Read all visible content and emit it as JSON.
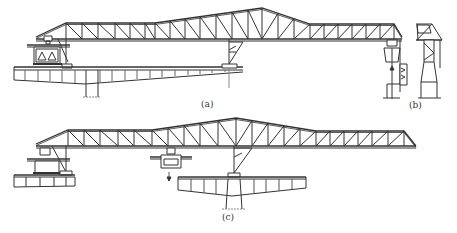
{
  "figure": {
    "stroke_color": "#333333",
    "light_stroke": "#888888",
    "background": "#ffffff"
  },
  "panels": [
    {
      "id": "a",
      "label": "(a)",
      "label_x": 201,
      "label_y": 98
    },
    {
      "id": "b",
      "label": "(b)",
      "label_x": 415,
      "label_y": 98
    },
    {
      "id": "c",
      "label": "(c)",
      "label_x": 222,
      "label_y": 208
    }
  ],
  "trusses": [
    {
      "id": "truss-a",
      "bottom_y": 39,
      "x_start": 36,
      "x_end": 402,
      "top_points": [
        [
          36,
          37
        ],
        [
          66,
          23
        ],
        [
          155,
          23
        ],
        [
          262,
          8
        ],
        [
          310,
          24
        ],
        [
          394,
          24
        ],
        [
          402,
          37
        ]
      ],
      "verticals": [
        66,
        82,
        98,
        115,
        130,
        145,
        155,
        170,
        185,
        200,
        216,
        232,
        248,
        262,
        278,
        294,
        310,
        324,
        338,
        352,
        366,
        380,
        394
      ],
      "inner_x_start": 110,
      "inner_x_end": 150
    },
    {
      "id": "truss-c",
      "bottom_y": 146,
      "x_start": 36,
      "x_end": 416,
      "top_points": [
        [
          36,
          144
        ],
        [
          68,
          130
        ],
        [
          152,
          130
        ],
        [
          236,
          118
        ],
        [
          316,
          131
        ],
        [
          404,
          131
        ],
        [
          416,
          146
        ]
      ],
      "verticals": [
        68,
        84,
        100,
        118,
        134,
        152,
        168,
        184,
        200,
        218,
        236,
        252,
        268,
        284,
        300,
        316,
        330,
        344,
        358,
        372,
        388,
        404
      ]
    }
  ],
  "panel_b": {
    "truss_top_y": 24,
    "truss_bottom_y": 40,
    "x_left": 392,
    "x_right": 432
  },
  "annotations": {
    "arrow_a": "load-lowering-arrow",
    "arrow_c": "segment-lowering-arrow"
  }
}
